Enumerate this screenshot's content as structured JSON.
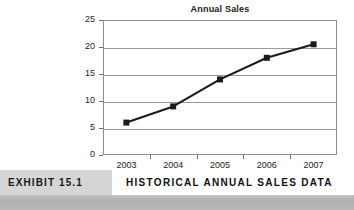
{
  "chart_data": {
    "type": "line",
    "title": "Annual Sales",
    "xlabel": "",
    "ylabel": "",
    "categories": [
      "2003",
      "2004",
      "2005",
      "2006",
      "2007"
    ],
    "values": [
      6,
      9,
      14,
      18,
      20.5
    ],
    "series": [
      {
        "name": "Annual Sales",
        "values": [
          6,
          9,
          14,
          18,
          20.5
        ]
      }
    ],
    "ylim": [
      0,
      25
    ],
    "yticks": [
      "0",
      "5",
      "10",
      "15",
      "20",
      "25"
    ],
    "ytick_values": [
      0,
      5,
      10,
      15,
      20,
      25
    ],
    "grid": "horizontal",
    "legend": "none",
    "marker": "square",
    "line_color": "#1a1a1a",
    "marker_color": "#1a1a1a",
    "grid_color": "#9a9a9a",
    "plot_border_color": "#8c8c8c"
  },
  "caption": {
    "exhibit_label": "EXHIBIT 15.1",
    "title": "HISTORICAL ANNUAL SALES DATA",
    "tag_background": "#d6d6d6"
  }
}
